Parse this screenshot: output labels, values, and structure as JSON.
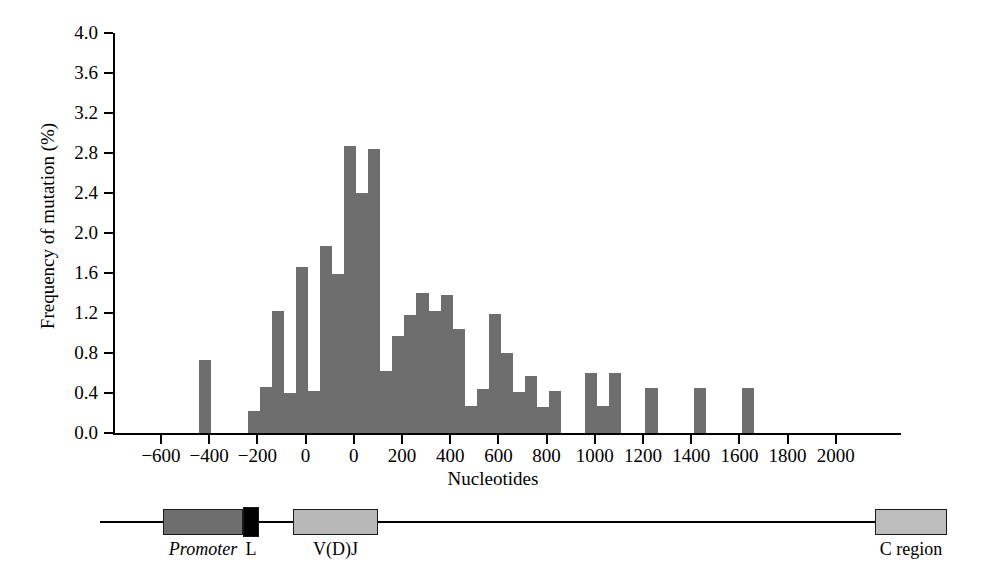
{
  "chart_data": {
    "type": "bar",
    "title": "",
    "xlabel": "Nucleotides",
    "ylabel": "Frequency of mutation (%)",
    "ylim": [
      0.0,
      4.0
    ],
    "ytick_labels": [
      "0.0",
      "0.4",
      "0.8",
      "1.2",
      "1.6",
      "2.0",
      "2.4",
      "2.8",
      "3.2",
      "3.6",
      "4.0"
    ],
    "ytick_values": [
      0.0,
      0.4,
      0.8,
      1.2,
      1.6,
      2.0,
      2.4,
      2.8,
      3.2,
      3.6,
      4.0
    ],
    "xtick_labels": [
      "-600",
      "-400",
      "-200",
      "0",
      "0",
      "200",
      "400",
      "600",
      "800",
      "1000",
      "1200",
      "1400",
      "1600",
      "1800",
      "2000"
    ],
    "grid": false,
    "legend": "none",
    "bar_color": "#6e6e6e",
    "note": "Histogram of somatic hypermutation frequency along an immunoglobulin gene. The x axis restarts at 0 after the promoter/leader region, so two 0 tick labels appear.",
    "bins": [
      {
        "tick_index": 0.78,
        "value": 0.73
      },
      {
        "tick_index": 1.8,
        "value": 0.22
      },
      {
        "tick_index": 2.05,
        "value": 0.46
      },
      {
        "tick_index": 2.3,
        "value": 1.22
      },
      {
        "tick_index": 2.55,
        "value": 0.4
      },
      {
        "tick_index": 2.8,
        "value": 1.66
      },
      {
        "tick_index": 3.05,
        "value": 0.42
      },
      {
        "tick_index": 3.3,
        "value": 1.87
      },
      {
        "tick_index": 3.55,
        "value": 1.59
      },
      {
        "tick_index": 3.8,
        "value": 2.87
      },
      {
        "tick_index": 4.05,
        "value": 2.4
      },
      {
        "tick_index": 4.3,
        "value": 2.84
      },
      {
        "tick_index": 4.55,
        "value": 0.62
      },
      {
        "tick_index": 4.8,
        "value": 0.97
      },
      {
        "tick_index": 5.05,
        "value": 1.18
      },
      {
        "tick_index": 5.3,
        "value": 1.4
      },
      {
        "tick_index": 5.55,
        "value": 1.22
      },
      {
        "tick_index": 5.8,
        "value": 1.38
      },
      {
        "tick_index": 6.05,
        "value": 1.04
      },
      {
        "tick_index": 6.3,
        "value": 0.27
      },
      {
        "tick_index": 6.55,
        "value": 0.44
      },
      {
        "tick_index": 6.8,
        "value": 1.19
      },
      {
        "tick_index": 7.05,
        "value": 0.8
      },
      {
        "tick_index": 7.3,
        "value": 0.41
      },
      {
        "tick_index": 7.55,
        "value": 0.57
      },
      {
        "tick_index": 7.8,
        "value": 0.26
      },
      {
        "tick_index": 8.05,
        "value": 0.42
      },
      {
        "tick_index": 8.8,
        "value": 0.6
      },
      {
        "tick_index": 9.05,
        "value": 0.27
      },
      {
        "tick_index": 9.3,
        "value": 0.6
      },
      {
        "tick_index": 10.05,
        "value": 0.45
      },
      {
        "tick_index": 11.05,
        "value": 0.45
      },
      {
        "tick_index": 12.05,
        "value": 0.45
      }
    ]
  },
  "gene": {
    "segments": [
      {
        "label": "Promoter",
        "italic": true,
        "color": "#6e6e6e",
        "left": 163,
        "width": 80
      },
      {
        "label": "L",
        "italic": false,
        "color": "#000000",
        "left": 243,
        "width": 16
      },
      {
        "label": "V(D)J",
        "italic": false,
        "color": "#b8b8b8",
        "left": 293,
        "width": 85
      },
      {
        "label": "C region",
        "italic": false,
        "color": "#bdbdbd",
        "left": 875,
        "width": 72
      }
    ]
  }
}
